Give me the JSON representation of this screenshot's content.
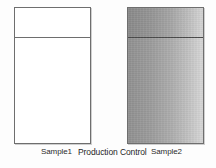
{
  "figure": {
    "background_color": "#fdfdfd",
    "border_color": "#6e6e6e"
  },
  "panels": [
    {
      "id": "sample1",
      "label": "Sample1",
      "finish": "unfinished-white",
      "fill_color": "#ffffff",
      "has_top_rail": true
    },
    {
      "id": "sample2",
      "label": "Sample2",
      "finish": "shaded-gray-gradient",
      "fill_color_left": "#8f8f8f",
      "fill_color_right": "#d4d4d4",
      "has_top_rail": true
    }
  ],
  "captions": {
    "sample1": "Sample1",
    "center": "Production Control",
    "sample2": "Sample2"
  }
}
